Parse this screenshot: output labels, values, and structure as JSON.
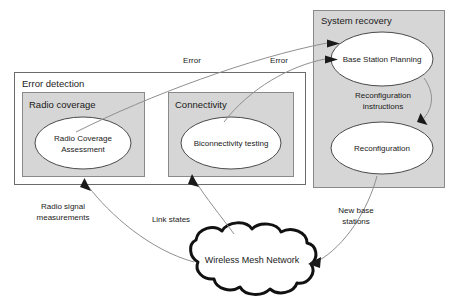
{
  "diagram": {
    "colors": {
      "panel_fill": "#ffffff",
      "shaded_fill": "#d6d6d6",
      "node_fill": "#ffffff",
      "node_stroke": "#4a4a4a",
      "edge_stroke": "#8f8f8f",
      "arrow_head": "#1a1a1a",
      "cloud_stroke": "#111111",
      "text": "#1a1a1a"
    },
    "groups": [
      {
        "id": "error-detection",
        "label": "Error detection",
        "subgroups": [
          {
            "id": "radio-coverage",
            "label": "Radio coverage",
            "node": {
              "id": "radio-coverage-assessment",
              "line1": "Radio Coverage",
              "line2": "Assessment"
            }
          },
          {
            "id": "connectivity",
            "label": "Connectivity",
            "node": {
              "id": "biconnectivity-testing",
              "line1": "Biconnectivity testing",
              "line2": ""
            }
          }
        ]
      },
      {
        "id": "system-recovery",
        "label": "System recovery",
        "nodes": [
          {
            "id": "base-station-planning",
            "label": "Base Station Planning"
          },
          {
            "id": "reconfiguration",
            "label": "Reconfiguration"
          }
        ]
      }
    ],
    "cloud": {
      "id": "wireless-mesh-network",
      "label": "Wireless Mesh Network"
    },
    "edges": [
      {
        "id": "edge-error-1",
        "label": "Error",
        "from": "radio-coverage-assessment",
        "to": "base-station-planning"
      },
      {
        "id": "edge-error-2",
        "label": "Error",
        "from": "biconnectivity-testing",
        "to": "base-station-planning"
      },
      {
        "id": "edge-reconfiguration-instructions",
        "label_line1": "Reconfiguration",
        "label_line2": "instructions",
        "from": "base-station-planning",
        "to": "reconfiguration"
      },
      {
        "id": "edge-radio-signal-measurements",
        "label_line1": "Radio signal",
        "label_line2": "measurements",
        "from": "wireless-mesh-network",
        "to": "radio-coverage-assessment"
      },
      {
        "id": "edge-link-states",
        "label_line1": "Link states",
        "label_line2": "",
        "from": "wireless-mesh-network",
        "to": "biconnectivity-testing"
      },
      {
        "id": "edge-new-base-stations",
        "label_line1": "New base",
        "label_line2": "stations",
        "from": "reconfiguration",
        "to": "wireless-mesh-network"
      }
    ]
  }
}
